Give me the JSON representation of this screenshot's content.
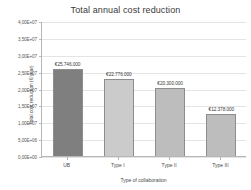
{
  "chart_data": {
    "type": "bar",
    "title": "Total annual cost reduction",
    "xlabel": "Type of collaboration",
    "ylabel": "Total cost reduction (€/year)",
    "categories": [
      "UB",
      "Type I",
      "Type II",
      "Type III"
    ],
    "values": [
      25746000,
      22776000,
      20300000,
      12378000
    ],
    "data_labels": [
      "€25.746.000",
      "€22.776.000",
      "€20.300.000",
      "€12.378.000"
    ],
    "ylim": [
      0,
      40000000
    ],
    "ytick_labels": [
      "4,00E+07",
      "3,50E+07",
      "3,00E+07",
      "2,50E+07",
      "2,00E+07",
      "1,50E+07",
      "1,00E+07",
      "5,00E+06",
      "0,00E+00"
    ],
    "ytick_values": [
      40000000,
      35000000,
      30000000,
      25000000,
      20000000,
      15000000,
      10000000,
      5000000,
      0
    ],
    "grid": true,
    "legend": "none",
    "bar_colors": [
      "#7f7f7f",
      "#cbcbcb",
      "#bdbdbd",
      "#bdbdbd"
    ],
    "bar_border_color": "#8d8d8d",
    "background": "#ffffff"
  }
}
